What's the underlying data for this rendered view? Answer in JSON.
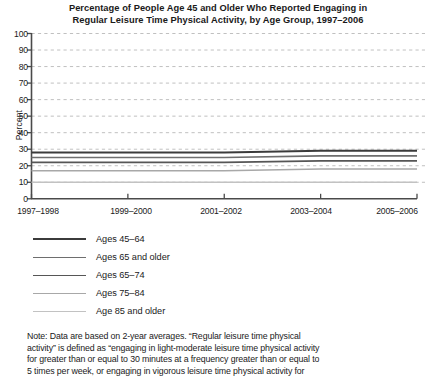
{
  "chart_data": {
    "type": "line",
    "title": "Percentage of People Age 45 and Older Who Reported Engaging in Regular Leisure Time Physical Activity, by Age Group, 1997–2006",
    "title_lines": [
      "Percentage of People Age 45 and Older Who Reported Engaging in",
      "Regular Leisure Time Physical Activity, by Age Group, 1997–2006"
    ],
    "xlabel": "",
    "ylabel": "Percent",
    "ylim": [
      0,
      100
    ],
    "ytick_step": 10,
    "yticks": [
      100,
      90,
      80,
      70,
      60,
      50,
      40,
      30,
      20,
      10,
      0
    ],
    "categories": [
      "1997–1998",
      "1999–2000",
      "2001–2002",
      "2003–2004",
      "2005–2006"
    ],
    "grid": true,
    "grid_style": "dashed-horizontal",
    "legend_position": "below-plot",
    "series": [
      {
        "name": "Ages 45–64",
        "values": [
          28,
          28,
          28,
          29,
          29
        ],
        "color": "#3b3b3b",
        "width": 2.0
      },
      {
        "name": "Ages 65 and older",
        "values": [
          25,
          25,
          25,
          26,
          26
        ],
        "color": "#6e6e6e",
        "width": 1.7
      },
      {
        "name": "Ages 65–74",
        "values": [
          22,
          22,
          22,
          23,
          23
        ],
        "color": "#565656",
        "width": 1.7
      },
      {
        "name": "Ages 75–84",
        "values": [
          17,
          17,
          17,
          18,
          18
        ],
        "color": "#a8a8a8",
        "width": 1.5
      },
      {
        "name": "Age 85 and older",
        "values": [
          10,
          10,
          10,
          10,
          10
        ],
        "color": "#c2c2c2",
        "width": 1.5
      }
    ]
  },
  "legend": {
    "items": [
      {
        "label": "Ages 45–64"
      },
      {
        "label": "Ages 65 and older"
      },
      {
        "label": "Ages 65–74"
      },
      {
        "label": "Ages 75–84"
      },
      {
        "label": "Age 85 and older"
      }
    ]
  },
  "note": {
    "text": "Note: Data are based on 2-year averages. “Regular leisure time physical activity” is defined as “engaging in light-moderate leisure time physical activity for greater than or equal to 30 minutes at a frequency greater than or equal to 5 times per week, or engaging in vigorous leisure time physical activity for",
    "lines": [
      "Note: Data are based on 2-year averages. “Regular leisure time physical",
      "activity” is defined as “engaging in light-moderate leisure time physical activity",
      "for greater than or equal to 30 minutes at a frequency greater than or equal to",
      "5 times per week, or engaging in vigorous leisure time physical activity for"
    ]
  },
  "colors": {
    "axis": "#4a4a4a",
    "grid": "#b9b9b9",
    "text": "#1a1a1a",
    "background": "#ffffff"
  }
}
